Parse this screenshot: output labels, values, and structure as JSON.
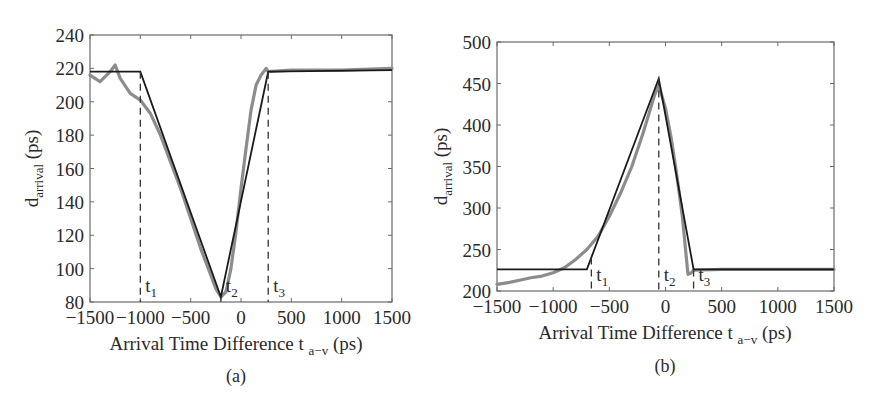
{
  "figure": {
    "panels": [
      "(a)",
      "(b)"
    ]
  },
  "chart_data": [
    {
      "panel": "(a)",
      "type": "line",
      "title": "",
      "xlabel": "Arrival Time Difference t a−v (ps)",
      "xlabel_main": "Arrival Time Difference t",
      "xlabel_sub": "a−v",
      "xlabel_unit": "(ps)",
      "ylabel": "d_arrival (ps)",
      "ylabel_main": "d",
      "ylabel_sub": "arrival",
      "ylabel_unit": "(ps)",
      "xlim": [
        -1500,
        1500
      ],
      "ylim": [
        80,
        240
      ],
      "xticks": [
        -1500,
        -1000,
        -500,
        0,
        500,
        1000,
        1500
      ],
      "xtick_labels": [
        "−1500",
        "−1000",
        "−500",
        "0",
        "500",
        "1000",
        "1500"
      ],
      "yticks": [
        80,
        100,
        120,
        140,
        160,
        180,
        200,
        220,
        240
      ],
      "ytick_labels": [
        "80",
        "100",
        "120",
        "140",
        "160",
        "180",
        "200",
        "220",
        "240"
      ],
      "grid": false,
      "legend": null,
      "series": [
        {
          "name": "piecewise linear model",
          "color": "#1a1a1a",
          "x": [
            -1500,
            -1000,
            -200,
            270,
            1500
          ],
          "y": [
            218,
            218,
            83,
            218,
            219
          ]
        },
        {
          "name": "measured",
          "color": "#8c8c8c",
          "x": [
            -1500,
            -1450,
            -1400,
            -1300,
            -1250,
            -1200,
            -1100,
            -1000,
            -900,
            -800,
            -700,
            -600,
            -500,
            -400,
            -300,
            -250,
            -200,
            -150,
            -100,
            -50,
            0,
            50,
            100,
            150,
            200,
            250,
            270,
            500,
            1000,
            1500
          ],
          "y": [
            216,
            214,
            212,
            218,
            222,
            214,
            205,
            201,
            193,
            180,
            164,
            148,
            130,
            112,
            96,
            88,
            83,
            86,
            100,
            122,
            148,
            172,
            195,
            210,
            216,
            220,
            218,
            219,
            219,
            220
          ]
        }
      ],
      "markers": [
        {
          "label": "t",
          "sub": "1",
          "x": -1000
        },
        {
          "label": "t",
          "sub": "2",
          "x": -200
        },
        {
          "label": "t",
          "sub": "3",
          "x": 270
        }
      ]
    },
    {
      "panel": "(b)",
      "type": "line",
      "title": "",
      "xlabel": "Arrival Time Difference t a−v (ps)",
      "xlabel_main": "Arrival Time Difference t",
      "xlabel_sub": "a−v",
      "xlabel_unit": "(ps)",
      "ylabel": "d_arrival (ps)",
      "ylabel_main": "d",
      "ylabel_sub": "arrival",
      "ylabel_unit": "(ps)",
      "xlim": [
        -1500,
        1500
      ],
      "ylim": [
        200,
        500
      ],
      "xticks": [
        -1500,
        -1000,
        -500,
        0,
        500,
        1000,
        1500
      ],
      "xtick_labels": [
        "−1500",
        "−1000",
        "−500",
        "0",
        "500",
        "1000",
        "1500"
      ],
      "yticks": [
        200,
        250,
        300,
        350,
        400,
        450,
        500
      ],
      "ytick_labels": [
        "200",
        "250",
        "300",
        "350",
        "400",
        "450",
        "500"
      ],
      "grid": false,
      "legend": null,
      "series": [
        {
          "name": "piecewise linear model",
          "color": "#1a1a1a",
          "x": [
            -1500,
            -700,
            -60,
            250,
            1500
          ],
          "y": [
            226,
            226,
            456,
            226,
            226
          ]
        },
        {
          "name": "measured",
          "color": "#8c8c8c",
          "x": [
            -1500,
            -1400,
            -1300,
            -1200,
            -1100,
            -1000,
            -900,
            -800,
            -700,
            -600,
            -500,
            -400,
            -300,
            -200,
            -100,
            -60,
            0,
            50,
            100,
            150,
            200,
            230,
            250,
            500,
            1000,
            1500
          ],
          "y": [
            208,
            210,
            213,
            216,
            218,
            222,
            228,
            238,
            250,
            266,
            290,
            318,
            350,
            390,
            435,
            448,
            420,
            385,
            340,
            290,
            220,
            222,
            225,
            226,
            226,
            226
          ]
        }
      ],
      "markers": [
        {
          "label": "t",
          "sub": "1",
          "x": -660
        },
        {
          "label": "t",
          "sub": "2",
          "x": -60
        },
        {
          "label": "t",
          "sub": "3",
          "x": 250
        }
      ]
    }
  ]
}
